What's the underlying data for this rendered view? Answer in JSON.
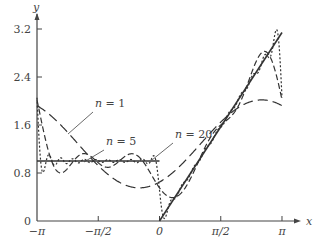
{
  "chart_data": {
    "type": "line",
    "title": "",
    "xlabel": "x",
    "ylabel": "y",
    "xlim": [
      -3.14159,
      3.14159
    ],
    "ylim": [
      0,
      3.3
    ],
    "x_ticks": [
      {
        "value": -3.14159,
        "label": "−π"
      },
      {
        "value": -1.5708,
        "label": "−π/2"
      },
      {
        "value": 0,
        "label": "0"
      },
      {
        "value": 1.5708,
        "label": "π/2"
      },
      {
        "value": 3.14159,
        "label": "π"
      }
    ],
    "y_ticks": [
      {
        "value": 0,
        "label": "0"
      },
      {
        "value": 0.8,
        "label": "0.8"
      },
      {
        "value": 1.6,
        "label": "1.6"
      },
      {
        "value": 2.4,
        "label": "2.4"
      },
      {
        "value": 3.2,
        "label": "3.2"
      }
    ],
    "grid": false,
    "function": {
      "description": "f(x) = 1 for -π<x<0, f(x) = x for 0<x<π",
      "segments": [
        {
          "x": [
            -3.14159,
            0
          ],
          "y": [
            1,
            1
          ]
        },
        {
          "x": [
            0,
            3.14159
          ],
          "y": [
            0,
            3.14159
          ]
        }
      ]
    },
    "series": [
      {
        "name": "n = 1",
        "n": 1,
        "dash": "10,5"
      },
      {
        "name": "n = 5",
        "n": 5,
        "dash": "6,3"
      },
      {
        "name": "n = 20",
        "n": 20,
        "dash": "2,2"
      }
    ],
    "annotations": [
      {
        "text_var": "n",
        "text_val": " = 1",
        "x": 95,
        "y": 107,
        "line": [
          93,
          112,
          68,
          134
        ]
      },
      {
        "text_var": "n",
        "text_val": " = 5",
        "x": 106,
        "y": 145,
        "line": [
          104,
          150,
          84,
          162
        ]
      },
      {
        "text_var": "n",
        "text_val": " = 20",
        "x": 175,
        "y": 138,
        "line": [
          173,
          143,
          152,
          160
        ]
      }
    ]
  },
  "axes": {
    "x_label": "x",
    "y_label": "y"
  }
}
